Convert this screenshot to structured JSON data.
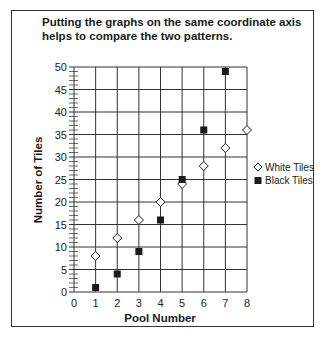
{
  "caption": "Putting the graphs on the same coordinate axis helps to compare the two patterns.",
  "chart_data": {
    "type": "scatter",
    "title": "Putting the graphs on the same coordinate axis helps to compare the two patterns.",
    "xlabel": "Pool Number",
    "ylabel": "Number of Tiles",
    "xlim": [
      0,
      8
    ],
    "ylim": [
      0,
      50
    ],
    "x_ticks": [
      0,
      1,
      2,
      3,
      4,
      5,
      6,
      7,
      8
    ],
    "y_ticks": [
      0,
      5,
      10,
      15,
      20,
      25,
      30,
      35,
      40,
      45,
      50
    ],
    "grid": true,
    "legend_position": "right",
    "series": [
      {
        "name": "White Tiles",
        "marker": "open-diamond",
        "color": "#ffffff",
        "x": [
          1,
          2,
          3,
          4,
          5,
          6,
          7,
          8
        ],
        "values": [
          8,
          12,
          16,
          20,
          24,
          28,
          32,
          36
        ]
      },
      {
        "name": "Black Tiles",
        "marker": "filled-square",
        "color": "#1a1a1a",
        "x": [
          1,
          2,
          3,
          4,
          5,
          6,
          7
        ],
        "values": [
          1,
          4,
          9,
          16,
          25,
          36,
          49
        ]
      }
    ]
  },
  "legend": {
    "white_label": "White Tiles",
    "black_label": "Black Tiles"
  }
}
